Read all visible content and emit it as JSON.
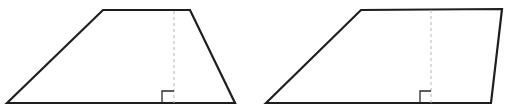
{
  "figure": {
    "background": "#ffffff",
    "stroke_color": "#1e1e1e",
    "height_line_color": "#b5b5b5",
    "shapes": [
      {
        "name": "trapezoid-left",
        "type": "isosceles-like trapezoid",
        "vertices": [
          [
            7,
            103
          ],
          [
            103,
            10
          ],
          [
            190,
            10
          ],
          [
            235,
            103
          ]
        ],
        "height_line": {
          "x": 174,
          "y_top": 10,
          "y_bottom": 103
        },
        "right_angle_marker": {
          "x_left": 162,
          "x_right": 174,
          "y_top": 91,
          "y_bottom": 103
        }
      },
      {
        "name": "trapezoid-right",
        "type": "right-leaning trapezoid",
        "vertices": [
          [
            266,
            103
          ],
          [
            361,
            10
          ],
          [
            502,
            9
          ],
          [
            491,
            103
          ]
        ],
        "height_line": {
          "x": 431,
          "y_top": 9,
          "y_bottom": 103
        },
        "right_angle_marker": {
          "x_left": 420,
          "x_right": 431,
          "y_top": 91,
          "y_bottom": 103
        }
      }
    ]
  }
}
